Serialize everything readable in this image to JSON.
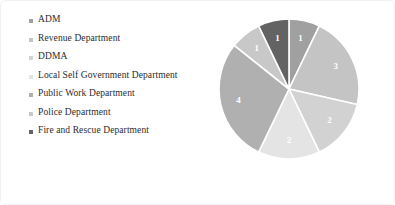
{
  "chart_data": {
    "type": "pie",
    "title": "",
    "categories": [
      "ADM",
      "Revenue Department",
      "DDMA",
      "Local Self Government Department",
      "Public Work Department",
      "Police Department",
      "Fire and Rescue Department"
    ],
    "values": [
      1,
      3,
      2,
      2,
      4,
      1,
      1
    ],
    "data_labels": [
      "1",
      "3",
      "2",
      "2",
      "4",
      "1",
      "1"
    ],
    "colors": [
      "#a0a0a0",
      "#c4c4c4",
      "#d2d2d2",
      "#e4e4e4",
      "#b0b0b0",
      "#c8c8c8",
      "#636363"
    ],
    "total": 14,
    "start_angle_deg": 0,
    "direction": "clockwise",
    "legend_position": "left",
    "grid": false,
    "slice_border_color": "#ffffff",
    "label_color": "#ffffff",
    "background": "#ffffff"
  },
  "legend": {
    "items": [
      {
        "label": "ADM",
        "color": "#a0a0a0"
      },
      {
        "label": "Revenue Department",
        "color": "#c4c4c4"
      },
      {
        "label": "DDMA",
        "color": "#d2d2d2"
      },
      {
        "label": "Local Self Government Department",
        "color": "#e4e4e4"
      },
      {
        "label": "Public Work Department",
        "color": "#b0b0b0"
      },
      {
        "label": "Police Department",
        "color": "#c8c8c8"
      },
      {
        "label": "Fire and Rescue Department",
        "color": "#636363"
      }
    ]
  }
}
